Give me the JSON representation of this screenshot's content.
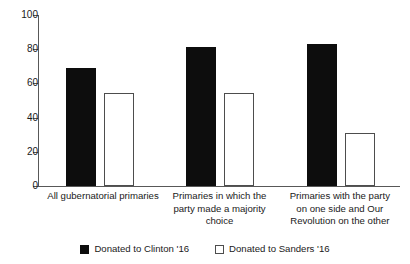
{
  "chart_data": {
    "type": "bar",
    "title": "",
    "xlabel": "",
    "ylabel": "",
    "ylim": [
      0,
      100
    ],
    "yticks": [
      0,
      20,
      40,
      60,
      80,
      100
    ],
    "grid": false,
    "legend_position": "bottom",
    "categories": [
      "All gubernatorial primaries",
      "Primaries in which the party made a majority choice",
      "Primaries with the party on one side and Our Revolution on the other"
    ],
    "category_lines": [
      [
        "All gubernatorial primaries"
      ],
      [
        "Primaries in which the",
        "party made a majority",
        "choice"
      ],
      [
        "Primaries with the party",
        "on one side and Our",
        "Revolution on the other"
      ]
    ],
    "series": [
      {
        "name": "Donated to Clinton '16",
        "values": [
          68,
          80,
          82
        ],
        "color": "#0d0d0d",
        "style": "filled"
      },
      {
        "name": "Donated to Sanders '16",
        "values": [
          53,
          53,
          30
        ],
        "color": "#ffffff",
        "style": "hollow"
      }
    ]
  },
  "legend": {
    "items": [
      {
        "label": "Donated to Clinton '16",
        "style": "filled"
      },
      {
        "label": "Donated to Sanders '16",
        "style": "hollow"
      }
    ]
  },
  "axis": {
    "tick_labels": [
      "0",
      "20",
      "40",
      "60",
      "80",
      "100"
    ]
  }
}
